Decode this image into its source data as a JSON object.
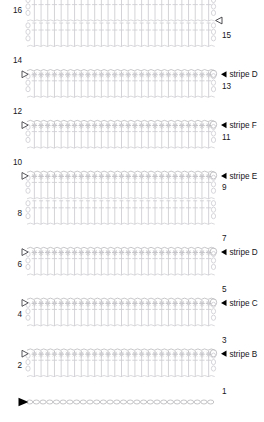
{
  "chart_data": {
    "type": "table",
    "total_rows": 16,
    "stitches_per_row": 27,
    "row_numbers_left": [
      "16",
      "14",
      "12",
      "10",
      "8",
      "6",
      "4",
      "2"
    ],
    "row_numbers_right": [
      "15",
      "13",
      "11",
      "9",
      "7",
      "5",
      "3",
      "1"
    ],
    "rows": [
      {
        "number": "16",
        "side": "left",
        "type": "double-crochet",
        "stripe": null
      },
      {
        "number": "15",
        "side": "right",
        "type": "double-crochet",
        "stripe": null
      },
      {
        "number": "14",
        "side": "left",
        "type": "double-crochet",
        "stripe": "stripe D"
      },
      {
        "number": "13",
        "side": "right",
        "type": "double-crochet",
        "stripe": null
      },
      {
        "number": "12",
        "side": "left",
        "type": "double-crochet",
        "stripe": "stripe F"
      },
      {
        "number": "11",
        "side": "right",
        "type": "double-crochet",
        "stripe": null
      },
      {
        "number": "10",
        "side": "left",
        "type": "double-crochet",
        "stripe": "stripe E"
      },
      {
        "number": "9",
        "side": "right",
        "type": "double-crochet",
        "stripe": null
      },
      {
        "number": "8",
        "side": "left",
        "type": "double-crochet",
        "stripe": null
      },
      {
        "number": "7",
        "side": "right",
        "type": "double-crochet",
        "stripe": "stripe D"
      },
      {
        "number": "6",
        "side": "left",
        "type": "double-crochet",
        "stripe": null
      },
      {
        "number": "5",
        "side": "right",
        "type": "double-crochet",
        "stripe": "stripe C"
      },
      {
        "number": "4",
        "side": "left",
        "type": "double-crochet",
        "stripe": null
      },
      {
        "number": "3",
        "side": "right",
        "type": "double-crochet",
        "stripe": "stripe B"
      },
      {
        "number": "2",
        "side": "left",
        "type": "double-crochet",
        "stripe": null
      },
      {
        "number": "1",
        "side": "right",
        "type": "foundation-chain",
        "stripe": null
      }
    ],
    "stripe_labels": [
      "stripe D",
      "stripe F",
      "stripe E",
      "stripe D",
      "stripe C",
      "stripe B"
    ],
    "colors": {
      "stitch": "#b9b9bd",
      "stitch_light": "#cfcfd4",
      "text": "#16161a",
      "marker_fill": "#000000",
      "background": "#ffffff"
    },
    "markers": {
      "start_arrow": "filled-right-triangle",
      "end_arrow": "hollow-left-triangle",
      "stripe_start": "hollow-right-triangle",
      "stripe_pointer": "filled-left-triangle"
    },
    "legend": {
      "stripe_d_1": "stripe D",
      "stripe_f": "stripe F",
      "stripe_e": "stripe E",
      "stripe_d_2": "stripe D",
      "stripe_c": "stripe C",
      "stripe_b": "stripe B"
    }
  }
}
